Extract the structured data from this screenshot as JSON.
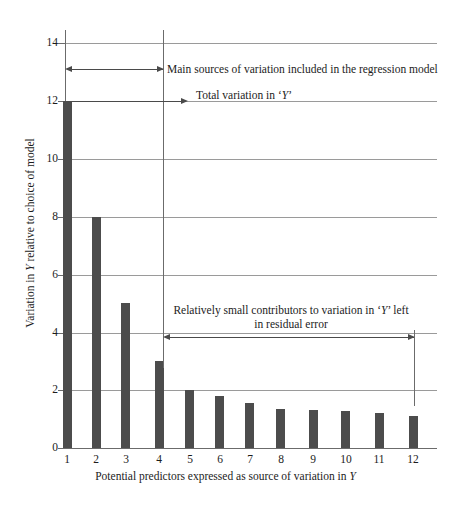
{
  "chart_data": {
    "type": "bar",
    "title": "",
    "xlabel": "Potential predictors expressed as source of variation in Y",
    "ylabel": "Variation in Y relative to choice of model",
    "categories": [
      "1",
      "2",
      "3",
      "4",
      "5",
      "6",
      "7",
      "8",
      "9",
      "10",
      "11",
      "12"
    ],
    "values": [
      12,
      8,
      5,
      3,
      2,
      1.8,
      1.55,
      1.35,
      1.3,
      1.28,
      1.2,
      1.1
    ],
    "ylim": [
      0,
      14
    ],
    "ytick_labels": [
      "0",
      "2",
      "4",
      "6",
      "8",
      "10",
      "12",
      "14"
    ],
    "ytick_values": [
      0,
      2,
      4,
      6,
      8,
      10,
      12,
      14
    ],
    "xtick_labels": [
      "1",
      "2",
      "3",
      "4",
      "5",
      "6",
      "7",
      "8",
      "9",
      "10",
      "11",
      "12"
    ],
    "grid": true,
    "legend": "none",
    "bar_color": "#4c4c4c",
    "grid_color": "#9a9a9a",
    "axis_color": "#6b6b6b",
    "annotations": [
      {
        "id": "main-sources",
        "text": "Main sources of variation included in the regression model",
        "y_value": 13.1,
        "span_x": [
          1,
          4
        ],
        "style": "double-headed-arrow-left-of-text"
      },
      {
        "id": "total-variation",
        "text": "Total variation in 'Y'",
        "y_value": 12,
        "span_x": [
          1,
          4
        ],
        "style": "arrow-right-to-text"
      },
      {
        "id": "residual-error",
        "text": "Relatively small contributors to variation in 'Y' left in residual error",
        "line1": "Relatively small contributors to variation in 'Y' left",
        "line2": "in residual error",
        "y_value": 4.1,
        "span_x": [
          4,
          12
        ],
        "style": "double-headed-arrow-under-text"
      }
    ]
  },
  "axes": {
    "y_title_pre": "Variation in ",
    "y_title_italic": "Y",
    "y_title_post": " relative to choice of model",
    "x_title_pre": "Potential predictors expressed as source of variation in ",
    "x_title_italic": "Y",
    "x_title_post": ""
  },
  "annotation_text": {
    "main_sources": "Main sources of variation included in the regression model",
    "total_variation_pre": "Total variation in ",
    "total_variation_quote_open": "‘",
    "total_variation_italic": "Y",
    "total_variation_quote_close": "’",
    "residual_line1_pre": "Relatively small contributors to variation in ",
    "residual_line1_quote_open": "‘",
    "residual_line1_italic": "Y",
    "residual_line1_post": "’ left",
    "residual_line2": "in residual error"
  }
}
